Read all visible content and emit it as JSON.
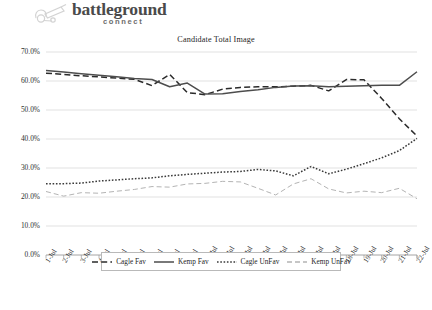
{
  "brand": {
    "icon": "cannon-icon",
    "wordmark": "battleground",
    "subword": "connect"
  },
  "chart_data": {
    "type": "line",
    "title": "Candidate Total Image",
    "xlabel": "",
    "ylabel": "",
    "grid": true,
    "legend_position": "bottom",
    "ylim": [
      0,
      70
    ],
    "ytick_labels": [
      "70.0%",
      "60.0%",
      "50.0%",
      "40.0%",
      "30.0%",
      "20.0%",
      "10.0%",
      "0.0%"
    ],
    "ytick_values": [
      70,
      60,
      50,
      40,
      30,
      20,
      10,
      0
    ],
    "categories": [
      "1-Jul",
      "2-Jul",
      "3-Jul",
      "4-Jul",
      "5-Jul",
      "6-Jul",
      "7-Jul",
      "8-Jul",
      "9-Jul",
      "10-Jul",
      "11-Jul",
      "12-Jul",
      "13-Jul",
      "14-Jul",
      "15-Jul",
      "16-Jul",
      "17-Jul",
      "18-Jul",
      "19-Jul",
      "20-Jul",
      "21-Jul",
      "22-Jul"
    ],
    "series": [
      {
        "name": "Cagle Fav",
        "style": "dashed",
        "color": "#2b2b2b",
        "values": [
          62.7,
          62.3,
          61.8,
          61.4,
          61.0,
          60.6,
          58.4,
          62.3,
          56.0,
          55.3,
          57.2,
          57.8,
          58.0,
          58.0,
          58.2,
          58.5,
          56.6,
          60.5,
          60.4,
          54.0,
          47.0,
          41.0
        ]
      },
      {
        "name": "Kemp Fav",
        "style": "solid",
        "color": "#4d4d4d",
        "values": [
          63.6,
          63.1,
          62.5,
          62.0,
          61.5,
          60.9,
          60.5,
          58.0,
          59.3,
          55.5,
          55.6,
          56.4,
          57.0,
          57.8,
          58.3,
          58.4,
          58.0,
          58.2,
          58.4,
          58.5,
          58.5,
          63.2
        ]
      },
      {
        "name": "Cagle UnFav",
        "style": "dotted",
        "color": "#3a3a3a",
        "values": [
          24.6,
          24.6,
          24.8,
          25.5,
          25.9,
          26.3,
          26.6,
          27.3,
          27.8,
          28.2,
          28.6,
          28.8,
          29.5,
          29.0,
          27.3,
          30.5,
          28.0,
          29.6,
          31.5,
          33.5,
          36.0,
          40.2
        ]
      },
      {
        "name": "Kemp UnFav",
        "style": "dashdot",
        "color": "#b4b4b4",
        "values": [
          21.9,
          20.3,
          21.5,
          21.3,
          22.0,
          22.6,
          23.6,
          23.4,
          24.5,
          24.7,
          25.4,
          25.2,
          23.0,
          20.7,
          24.5,
          26.3,
          22.8,
          21.4,
          22.0,
          21.5,
          23.0,
          19.4
        ]
      }
    ]
  },
  "legend": {
    "items": [
      {
        "label": "Cagle Fav",
        "style": "dashed",
        "color": "#2b2b2b"
      },
      {
        "label": "Kemp Fav",
        "style": "solid",
        "color": "#4d4d4d"
      },
      {
        "label": "Cagle UnFav",
        "style": "dotted",
        "color": "#3a3a3a"
      },
      {
        "label": "Kemp UnFav",
        "style": "dashdot",
        "color": "#b4b4b4"
      }
    ]
  },
  "colors": {
    "grid": "#d4d4d4",
    "axis": "#9a9a9a",
    "text": "#1a1a1a",
    "brand": "#4a4a4a"
  }
}
